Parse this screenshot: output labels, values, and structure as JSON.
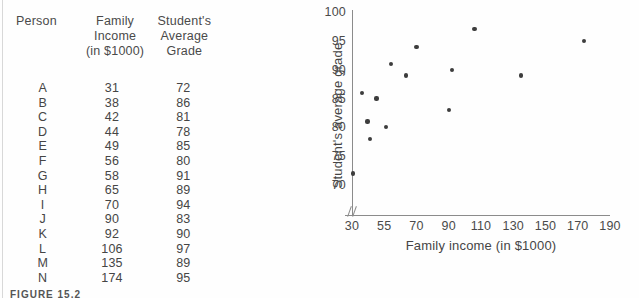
{
  "figure": {
    "caption": "FIGURE 15.2"
  },
  "table": {
    "headers": {
      "person": [
        "Person"
      ],
      "income": [
        "Family",
        "Income",
        "(in $1000)"
      ],
      "grade": [
        "Student's",
        "Average",
        "Grade"
      ]
    },
    "rows": [
      {
        "person": "A",
        "income": "31",
        "grade": "72"
      },
      {
        "person": "B",
        "income": "38",
        "grade": "86"
      },
      {
        "person": "C",
        "income": "42",
        "grade": "81"
      },
      {
        "person": "D",
        "income": "44",
        "grade": "78"
      },
      {
        "person": "E",
        "income": "49",
        "grade": "85"
      },
      {
        "person": "F",
        "income": "56",
        "grade": "80"
      },
      {
        "person": "G",
        "income": "58",
        "grade": "91"
      },
      {
        "person": "H",
        "income": "65",
        "grade": "89"
      },
      {
        "person": "I",
        "income": "70",
        "grade": "94"
      },
      {
        "person": "J",
        "income": "90",
        "grade": "83"
      },
      {
        "person": "K",
        "income": "92",
        "grade": "90"
      },
      {
        "person": "L",
        "income": "106",
        "grade": "97"
      },
      {
        "person": "M",
        "income": "135",
        "grade": "89"
      },
      {
        "person": "N",
        "income": "174",
        "grade": "95"
      }
    ]
  },
  "chart_data": {
    "type": "scatter",
    "title": "",
    "xlabel": "Family income (in $1000)",
    "ylabel": "Student's average grade",
    "xtick_labels": [
      "30",
      "55",
      "70",
      "90",
      "110",
      "130",
      "150",
      "170",
      "190"
    ],
    "ytick_labels": [
      "70",
      "75",
      "80",
      "85",
      "90",
      "95",
      "100"
    ],
    "ylim": [
      68,
      100
    ],
    "xlim": [
      28,
      192
    ],
    "x_axis_break": true,
    "grid": false,
    "legend": null,
    "point_color": "#3d3d3d",
    "points": [
      {
        "label": "A",
        "x": 31,
        "y": 72
      },
      {
        "label": "B",
        "x": 38,
        "y": 86
      },
      {
        "label": "C",
        "x": 42,
        "y": 81
      },
      {
        "label": "D",
        "x": 44,
        "y": 78
      },
      {
        "label": "E",
        "x": 49,
        "y": 85
      },
      {
        "label": "F",
        "x": 56,
        "y": 80
      },
      {
        "label": "G",
        "x": 58,
        "y": 91
      },
      {
        "label": "H",
        "x": 65,
        "y": 89
      },
      {
        "label": "I",
        "x": 70,
        "y": 94
      },
      {
        "label": "J",
        "x": 90,
        "y": 83
      },
      {
        "label": "K",
        "x": 92,
        "y": 90
      },
      {
        "label": "L",
        "x": 106,
        "y": 97
      },
      {
        "label": "M",
        "x": 135,
        "y": 89
      },
      {
        "label": "N",
        "x": 174,
        "y": 95
      }
    ]
  }
}
